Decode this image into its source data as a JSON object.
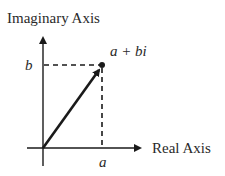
{
  "diagram": {
    "y_axis_label": "Imaginary Axis",
    "x_axis_label": "Real Axis",
    "point_label": "a + bi",
    "x_tick_label": "a",
    "y_tick_label": "b",
    "colors": {
      "ink": "#1a1a1a",
      "text": "#2a2a2a",
      "background": "#ffffff"
    }
  }
}
